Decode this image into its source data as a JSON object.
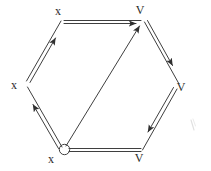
{
  "figure": {
    "type": "hand-drawn-geometry-diagram",
    "background_color": "#ffffff",
    "ink_color": "#3a3a3a",
    "label_color": "#2b2b2b",
    "width": 211,
    "height": 171,
    "shape": "hexagon",
    "diagonal_count": 1,
    "edge_style": "double-stroke-with-arrowhead",
    "vertices": [
      {
        "id": "top-left",
        "label": "x",
        "x": 63,
        "y": 21,
        "label_x": 58,
        "label_y": 15,
        "marker": "none"
      },
      {
        "id": "top-right",
        "label": "V",
        "x": 141,
        "y": 21,
        "label_x": 139,
        "label_y": 14,
        "marker": "none"
      },
      {
        "id": "right",
        "label": "V",
        "x": 177,
        "y": 85,
        "label_x": 178,
        "label_y": 90,
        "marker": "none"
      },
      {
        "id": "bottom-right",
        "label": "V",
        "x": 141,
        "y": 150,
        "label_x": 138,
        "label_y": 160,
        "marker": "none"
      },
      {
        "id": "bottom-left",
        "label": "x",
        "x": 63,
        "y": 150,
        "label_x": 50,
        "label_y": 162,
        "marker": "open-circle"
      },
      {
        "id": "left",
        "label": "x",
        "x": 26,
        "y": 85,
        "label_x": 13,
        "label_y": 88,
        "marker": "none"
      }
    ],
    "edges": [
      {
        "id": "edge-top",
        "from": "top-left",
        "to": "top-right",
        "direction": "left-to-right",
        "arrow_at": "top-right",
        "style": "double"
      },
      {
        "id": "edge-upper-right",
        "from": "top-right",
        "to": "right",
        "direction": "down-right",
        "arrow_at": "right",
        "style": "double"
      },
      {
        "id": "edge-lower-right",
        "from": "right",
        "to": "bottom-right",
        "direction": "down-left",
        "arrow_at": "bottom-right",
        "style": "double"
      },
      {
        "id": "edge-bottom",
        "from": "bottom-left",
        "to": "bottom-right",
        "direction": "left-to-right",
        "arrow_at": "none",
        "style": "double"
      },
      {
        "id": "edge-lower-left",
        "from": "bottom-left",
        "to": "left",
        "direction": "up-left",
        "arrow_at": "left",
        "style": "double"
      },
      {
        "id": "edge-upper-left",
        "from": "left",
        "to": "top-left",
        "direction": "up-right",
        "arrow_at": "top-left",
        "style": "double"
      }
    ],
    "diagonals": [
      {
        "id": "diagonal-main",
        "from": "bottom-left",
        "to": "top-right",
        "arrow_at": "top-right",
        "style": "single"
      }
    ],
    "stray_marks": [
      {
        "id": "stray-right",
        "x": 192,
        "y": 124,
        "description": "faint pencil smudge"
      }
    ]
  }
}
